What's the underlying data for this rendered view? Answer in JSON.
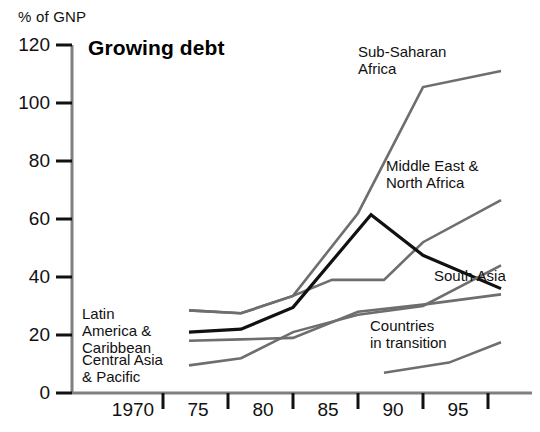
{
  "chart_data": {
    "type": "line",
    "title": "Growing debt",
    "ylabel": "% of GNP",
    "xlabel": "",
    "ylim": [
      0,
      120
    ],
    "xlim": [
      1967,
      1997
    ],
    "yticks": [
      0,
      20,
      40,
      60,
      80,
      100,
      120
    ],
    "ytick_labels": [
      "0",
      "20",
      "40",
      "60",
      "80",
      "100",
      "120"
    ],
    "xticks": [
      1970,
      1975,
      1980,
      1985,
      1990,
      1995
    ],
    "xtick_labels": [
      "1970",
      "75",
      "80",
      "85",
      "90",
      "95"
    ],
    "grid": false,
    "legend": "inline-annotations",
    "series": [
      {
        "name": "Sub-Saharan Africa",
        "color": "#6e6e6e",
        "label_text": "Sub-Saharan\nAfrica",
        "x": [
          1972,
          1976,
          1980,
          1985,
          1990,
          1996
        ],
        "values": [
          28.5,
          27.5,
          33.5,
          62.0,
          105.5,
          111.0
        ]
      },
      {
        "name": "Middle East & North Africa",
        "color": "#6e6e6e",
        "label_text": "Middle East &\nNorth Africa",
        "x": [
          1972,
          1976,
          1980,
          1983,
          1987,
          1990,
          1996
        ],
        "values": [
          28.5,
          27.5,
          33.5,
          39.0,
          39.0,
          52.0,
          66.5
        ]
      },
      {
        "name": "South Asia",
        "color": "#6e6e6e",
        "label_text": "South Asia",
        "x": [
          1972,
          1976,
          1980,
          1985,
          1990,
          1996
        ],
        "values": [
          18.0,
          18.5,
          19.0,
          28.0,
          30.5,
          34.0
        ]
      },
      {
        "name": "Latin America & Caribbean",
        "color": "#111111",
        "label_text": "Latin\nAmerica &\nCaribbean",
        "x": [
          1972,
          1976,
          1980,
          1986,
          1990,
          1996
        ],
        "values": [
          21.0,
          22.0,
          29.5,
          61.5,
          47.5,
          36.0
        ]
      },
      {
        "name": "Central Asia & Pacific",
        "color": "#6e6e6e",
        "label_text": "Central Asia\n& Pacific",
        "x": [
          1972,
          1976,
          1980,
          1985,
          1990,
          1996
        ],
        "values": [
          9.5,
          12.0,
          21.0,
          27.0,
          30.0,
          44.0
        ]
      },
      {
        "name": "Countries in transition",
        "color": "#6e6e6e",
        "label_text": "Countries\nin transition",
        "x": [
          1987,
          1992,
          1996
        ],
        "values": [
          7.0,
          10.5,
          17.5
        ]
      }
    ]
  },
  "labels": {
    "unit": "% of GNP",
    "title": "Growing debt",
    "sub_saharan": "Sub-Saharan\nAfrica",
    "middle_east": "Middle East &\nNorth Africa",
    "south_asia": "South Asia",
    "latin_america": "Latin\nAmerica &\nCaribbean",
    "central_asia": "Central Asia\n& Pacific",
    "countries_transition": "Countries\nin transition"
  }
}
